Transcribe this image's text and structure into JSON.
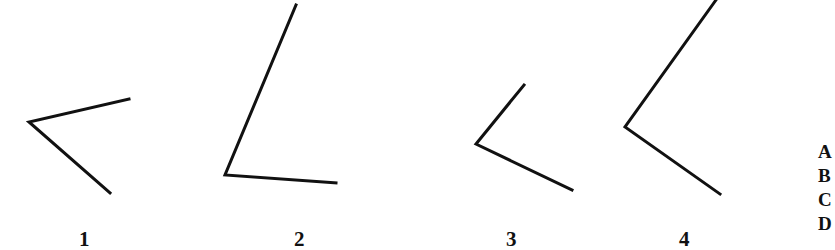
{
  "figure": {
    "angles": [
      {
        "label": "1"
      },
      {
        "label": "2"
      },
      {
        "label": "3"
      },
      {
        "label": "4"
      }
    ],
    "options_clipped": [
      "A",
      "B",
      "C",
      "D"
    ]
  },
  "colors": {
    "line": "#111111",
    "background": "#ffffff"
  }
}
